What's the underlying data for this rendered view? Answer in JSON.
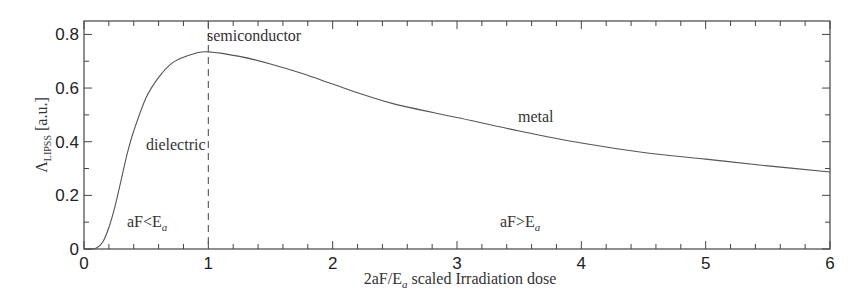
{
  "chart_data": {
    "type": "line",
    "title": "",
    "xlabel": "2aF/E_a scaled Irradiation dose",
    "xlabel_parts": {
      "pre": "2aF/E",
      "sub": "a",
      "post": " scaled Irradiation dose"
    },
    "ylabel": "Λ_LIPSS [a.u.]",
    "ylabel_parts": {
      "pre": "Λ",
      "sub": "LIPSS",
      "post": " [a.u.]"
    },
    "xlim": [
      0,
      6
    ],
    "ylim": [
      0,
      0.85
    ],
    "x_ticks": [
      0,
      1,
      2,
      3,
      4,
      5,
      6
    ],
    "x_tick_labels": [
      "0",
      "1",
      "2",
      "3",
      "4",
      "5",
      "6"
    ],
    "x_minor_step": 0.2,
    "y_ticks": [
      0,
      0.2,
      0.4,
      0.6,
      0.8
    ],
    "y_tick_labels": [
      "0",
      "0.2",
      "0.4",
      "0.6",
      "0.8"
    ],
    "y_minor_step": 0.1,
    "grid": false,
    "legend": null,
    "series": [
      {
        "name": "Λ_LIPSS",
        "style": "solid",
        "color": "#555555",
        "x": [
          0,
          0.05,
          0.1,
          0.15,
          0.2,
          0.25,
          0.3,
          0.35,
          0.4,
          0.5,
          0.6,
          0.7,
          0.8,
          0.9,
          1.0,
          1.25,
          1.5,
          1.75,
          2.0,
          2.25,
          2.5,
          3.0,
          3.5,
          4.0,
          4.5,
          5.0,
          5.5,
          6.0
        ],
        "values": [
          0,
          0,
          0.004,
          0.025,
          0.08,
          0.16,
          0.26,
          0.36,
          0.44,
          0.565,
          0.64,
          0.69,
          0.715,
          0.73,
          0.735,
          0.718,
          0.69,
          0.655,
          0.615,
          0.575,
          0.54,
          0.49,
          0.44,
          0.395,
          0.36,
          0.335,
          0.31,
          0.287
        ]
      }
    ],
    "vertical_marker": {
      "x": 1,
      "style": "dashed"
    },
    "annotations": [
      {
        "text": "semiconductor",
        "x": 1.0,
        "y": 0.78
      },
      {
        "text": "dielectric",
        "x": 0.5,
        "y": 0.37
      },
      {
        "text": "metal",
        "x": 3.48,
        "y": 0.47
      },
      {
        "text_pre": "aF<E",
        "sub": "a",
        "x": 0.36,
        "y": 0.08
      },
      {
        "text_pre": "aF>E",
        "sub": "a",
        "x": 3.35,
        "y": 0.08
      }
    ]
  },
  "colors": {
    "axis": "#444444",
    "curve": "#555555",
    "text": "#333333"
  }
}
